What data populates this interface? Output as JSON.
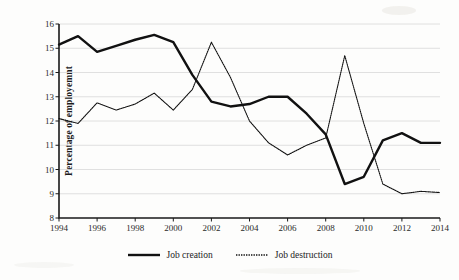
{
  "chart_data": {
    "type": "line",
    "title": "",
    "xlabel": "",
    "ylabel": "Percentage of employemnt",
    "xlim": [
      1994,
      2014
    ],
    "ylim": [
      8,
      16
    ],
    "ytick_labels": [
      "8",
      "9",
      "10",
      "11",
      "12",
      "13",
      "14",
      "15",
      "16"
    ],
    "yticks": [
      8,
      9,
      10,
      11,
      12,
      13,
      14,
      15,
      16
    ],
    "xtick_labels": [
      "1994",
      "1996",
      "1998",
      "2000",
      "2002",
      "2004",
      "2006",
      "2008",
      "2010",
      "2012",
      "2014"
    ],
    "xticks": [
      1994,
      1996,
      1998,
      2000,
      2002,
      2004,
      2006,
      2008,
      2010,
      2012,
      2014
    ],
    "x": [
      1994,
      1995,
      1996,
      1997,
      1998,
      1999,
      2000,
      2001,
      2002,
      2003,
      2004,
      2005,
      2006,
      2007,
      2008,
      2009,
      2010,
      2011,
      2012,
      2013,
      2014
    ],
    "grid": true,
    "grid_axis": "y",
    "legend_position": "bottom-center",
    "series": [
      {
        "name": "Job creation",
        "style": "solid",
        "color": "#111111",
        "width": 2.4,
        "values": [
          15.15,
          15.5,
          14.85,
          15.1,
          15.35,
          15.55,
          15.25,
          13.9,
          12.8,
          12.6,
          12.7,
          13.0,
          13.0,
          12.3,
          11.45,
          9.4,
          9.7,
          11.2,
          11.5,
          11.1,
          11.1
        ]
      },
      {
        "name": "Job destruction",
        "style": "dotted",
        "color": "#111111",
        "width": 1.1,
        "values": [
          12.1,
          11.9,
          12.75,
          12.45,
          12.7,
          13.15,
          12.45,
          13.3,
          15.25,
          13.8,
          12.0,
          11.1,
          10.6,
          11.0,
          11.3,
          14.7,
          11.9,
          9.4,
          9.0,
          9.1,
          9.05
        ]
      }
    ]
  },
  "legend": {
    "items": [
      {
        "label": "Job creation"
      },
      {
        "label": "Job destruction"
      }
    ]
  }
}
